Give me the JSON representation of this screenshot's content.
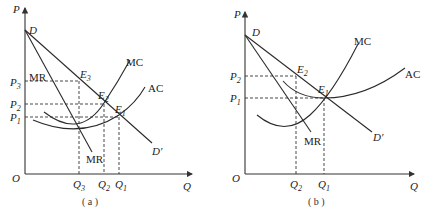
{
  "panels": [
    {
      "id": "a",
      "caption": "( a )",
      "axes": {
        "y_label": "P",
        "x_label": "Q",
        "origin_label": "O"
      },
      "price_levels": [
        {
          "label": "P",
          "sub": "3"
        },
        {
          "label": "P",
          "sub": "2"
        },
        {
          "label": "P",
          "sub": "1"
        }
      ],
      "quantity_levels": [
        {
          "label": "Q",
          "sub": "3"
        },
        {
          "label": "Q",
          "sub": "2"
        },
        {
          "label": "Q",
          "sub": "1"
        }
      ],
      "points": [
        {
          "label": "E",
          "sub": "3"
        },
        {
          "label": "E",
          "sub": "2"
        },
        {
          "label": "E",
          "sub": "1"
        }
      ],
      "curves": {
        "demand_start": "D",
        "demand_end": "D′",
        "mr_top": "MR",
        "mr_bottom": "MR",
        "mc": "MC",
        "ac": "AC"
      }
    },
    {
      "id": "b",
      "caption": "( b )",
      "axes": {
        "y_label": "P",
        "x_label": "Q",
        "origin_label": "O"
      },
      "price_levels": [
        {
          "label": "P",
          "sub": "2"
        },
        {
          "label": "P",
          "sub": "1"
        }
      ],
      "quantity_levels": [
        {
          "label": "Q",
          "sub": "2"
        },
        {
          "label": "Q",
          "sub": "1"
        }
      ],
      "points": [
        {
          "label": "E",
          "sub": "2"
        },
        {
          "label": "E",
          "sub": "1"
        }
      ],
      "curves": {
        "demand_start": "D",
        "demand_end": "D′",
        "mr_bottom": "MR",
        "mc": "MC",
        "ac": "AC"
      }
    }
  ]
}
